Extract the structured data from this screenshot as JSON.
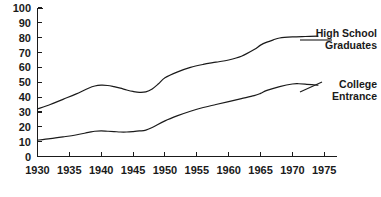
{
  "chart_data": {
    "type": "line",
    "title": "",
    "subtitle": "",
    "xlabel": "",
    "ylabel": "",
    "xlim": [
      1930,
      1977
    ],
    "ylim": [
      0,
      100
    ],
    "grid": false,
    "legend_position": "right-inline-labels",
    "x_tick_labels": [
      "1930",
      "1935",
      "1940",
      "1945",
      "1950",
      "1955",
      "1960",
      "1965",
      "1970",
      "1975"
    ],
    "x_ticks": [
      1930,
      1935,
      1940,
      1945,
      1950,
      1955,
      1960,
      1965,
      1970,
      1975
    ],
    "y_tick_labels": [
      "0",
      "10",
      "20",
      "30",
      "40",
      "50",
      "60",
      "70",
      "80",
      "90",
      "100"
    ],
    "y_ticks": [
      0,
      10,
      20,
      30,
      40,
      50,
      60,
      70,
      80,
      90,
      100
    ],
    "series": [
      {
        "name": "High School Graduates",
        "label_lines": [
          "High School",
          "Graduates"
        ],
        "x": [
          1930,
          1932,
          1934,
          1936,
          1938,
          1939,
          1940,
          1941,
          1942,
          1943,
          1944,
          1945,
          1946,
          1947,
          1948,
          1949,
          1950,
          1952,
          1954,
          1956,
          1958,
          1960,
          1962,
          1964,
          1965,
          1966,
          1967,
          1968,
          1970,
          1972,
          1974
        ],
        "values": [
          32,
          35,
          38.5,
          42,
          46,
          47.5,
          48,
          47.8,
          47,
          46,
          44.8,
          43.8,
          43.2,
          43.5,
          45.5,
          49,
          53,
          57,
          60,
          62,
          63.5,
          65,
          67.5,
          72,
          75,
          77,
          78.5,
          79.8,
          80.5,
          80.8,
          81
        ]
      },
      {
        "name": "College Entrance",
        "label_lines": [
          "College",
          "Entrance"
        ],
        "x": [
          1930,
          1932,
          1934,
          1936,
          1938,
          1939,
          1940,
          1941,
          1942,
          1943,
          1944,
          1945,
          1946,
          1947,
          1948,
          1950,
          1952,
          1954,
          1956,
          1958,
          1960,
          1962,
          1964,
          1965,
          1966,
          1968,
          1970,
          1971,
          1972,
          1974
        ],
        "values": [
          11,
          12,
          13.2,
          14.5,
          16.2,
          17,
          17.2,
          17,
          16.8,
          16.5,
          16.5,
          16.8,
          17.2,
          17.8,
          19.5,
          24,
          27.5,
          30.5,
          33,
          35,
          37,
          39,
          41,
          42.5,
          44.5,
          47,
          48.8,
          49,
          48.8,
          48
        ]
      }
    ]
  },
  "axes": {
    "y_axis_name": "vertical-axis",
    "x_axis_name": "horizontal-axis"
  }
}
